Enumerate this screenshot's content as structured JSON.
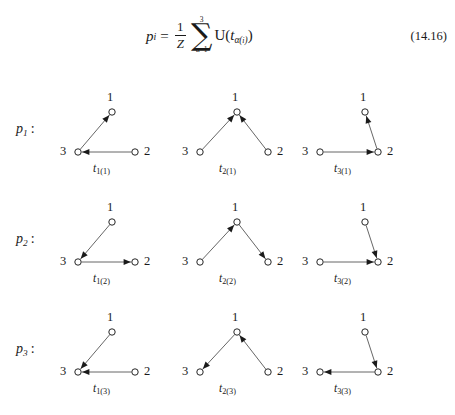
{
  "equation": {
    "lhs_var": "p",
    "lhs_sub": "i",
    "equals": "=",
    "frac_num": "1",
    "frac_den": "Z",
    "sum_upper": "3",
    "sum_lower": "α=1",
    "sigma": "∑",
    "tail_open": "U(",
    "tail_var": "t",
    "tail_sub_alpha": "α(",
    "tail_sub_i": "i",
    "tail_sub_close": ")",
    "tail_close": ")",
    "number": "(14.16)"
  },
  "rows": [
    {
      "label_var": "p",
      "label_sub": "1",
      "label_colon": ":",
      "diagrams": [
        {
          "edge_label_var": "t",
          "edge_label_sub": "1(1)",
          "nodes": [
            {
              "name": "node-1",
              "label": "1",
              "cx": 57,
              "cy": 27,
              "label_x": 52,
              "label_y": 6
            },
            {
              "name": "node-3",
              "label": "3",
              "cx": 23,
              "cy": 67,
              "label_x": 5,
              "label_y": 60
            },
            {
              "name": "node-2",
              "label": "2",
              "cx": 80,
              "cy": 67,
              "label_x": 89,
              "label_y": 60
            }
          ],
          "edges": [
            {
              "name": "edge-3-to-1",
              "from": "node-3",
              "to": "node-1"
            },
            {
              "name": "edge-2-to-3",
              "from": "node-2",
              "to": "node-3"
            }
          ],
          "label_x": 38,
          "label_y": 78
        },
        {
          "edge_label_var": "t",
          "edge_label_sub": "2(1)",
          "nodes": [
            {
              "name": "node-1",
              "label": "1",
              "cx": 52,
              "cy": 27,
              "label_x": 47,
              "label_y": 6
            },
            {
              "name": "node-3",
              "label": "3",
              "cx": 15,
              "cy": 67,
              "label_x": -3,
              "label_y": 60
            },
            {
              "name": "node-2",
              "label": "2",
              "cx": 83,
              "cy": 67,
              "label_x": 92,
              "label_y": 60
            }
          ],
          "edges": [
            {
              "name": "edge-3-to-1",
              "from": "node-3",
              "to": "node-1"
            },
            {
              "name": "edge-2-to-1",
              "from": "node-2",
              "to": "node-1"
            }
          ],
          "label_x": 34,
          "label_y": 78
        },
        {
          "edge_label_var": "t",
          "edge_label_sub": "3(1)",
          "nodes": [
            {
              "name": "node-1",
              "label": "1",
              "cx": 53,
              "cy": 27,
              "label_x": 48,
              "label_y": 6
            },
            {
              "name": "node-3",
              "label": "3",
              "cx": 8,
              "cy": 67,
              "label_x": -10,
              "label_y": 60
            },
            {
              "name": "node-2",
              "label": "2",
              "cx": 66,
              "cy": 67,
              "label_x": 75,
              "label_y": 60
            }
          ],
          "edges": [
            {
              "name": "edge-2-to-1",
              "from": "node-2",
              "to": "node-1"
            },
            {
              "name": "edge-3-to-2",
              "from": "node-3",
              "to": "node-2"
            }
          ],
          "label_x": 22,
          "label_y": 78
        }
      ]
    },
    {
      "label_var": "p",
      "label_sub": "2",
      "label_colon": ":",
      "diagrams": [
        {
          "edge_label_var": "t",
          "edge_label_sub": "1(2)",
          "nodes": [
            {
              "name": "node-1",
              "label": "1",
              "cx": 57,
              "cy": 27,
              "label_x": 52,
              "label_y": 6
            },
            {
              "name": "node-3",
              "label": "3",
              "cx": 23,
              "cy": 67,
              "label_x": 5,
              "label_y": 60
            },
            {
              "name": "node-2",
              "label": "2",
              "cx": 80,
              "cy": 67,
              "label_x": 89,
              "label_y": 60
            }
          ],
          "edges": [
            {
              "name": "edge-1-to-3",
              "from": "node-1",
              "to": "node-3"
            },
            {
              "name": "edge-3-to-2",
              "from": "node-3",
              "to": "node-2"
            }
          ],
          "label_x": 38,
          "label_y": 78
        },
        {
          "edge_label_var": "t",
          "edge_label_sub": "2(2)",
          "nodes": [
            {
              "name": "node-1",
              "label": "1",
              "cx": 52,
              "cy": 27,
              "label_x": 47,
              "label_y": 6
            },
            {
              "name": "node-3",
              "label": "3",
              "cx": 15,
              "cy": 67,
              "label_x": -3,
              "label_y": 60
            },
            {
              "name": "node-2",
              "label": "2",
              "cx": 83,
              "cy": 67,
              "label_x": 92,
              "label_y": 60
            }
          ],
          "edges": [
            {
              "name": "edge-3-to-1",
              "from": "node-3",
              "to": "node-1"
            },
            {
              "name": "edge-1-to-2",
              "from": "node-1",
              "to": "node-2"
            }
          ],
          "label_x": 34,
          "label_y": 78
        },
        {
          "edge_label_var": "t",
          "edge_label_sub": "3(2)",
          "nodes": [
            {
              "name": "node-1",
              "label": "1",
              "cx": 53,
              "cy": 27,
              "label_x": 48,
              "label_y": 6
            },
            {
              "name": "node-3",
              "label": "3",
              "cx": 8,
              "cy": 67,
              "label_x": -10,
              "label_y": 60
            },
            {
              "name": "node-2",
              "label": "2",
              "cx": 66,
              "cy": 67,
              "label_x": 75,
              "label_y": 60
            }
          ],
          "edges": [
            {
              "name": "edge-1-to-2",
              "from": "node-1",
              "to": "node-2"
            },
            {
              "name": "edge-3-to-2",
              "from": "node-3",
              "to": "node-2"
            }
          ],
          "label_x": 22,
          "label_y": 78
        }
      ]
    },
    {
      "label_var": "p",
      "label_sub": "3",
      "label_colon": ":",
      "diagrams": [
        {
          "edge_label_var": "t",
          "edge_label_sub": "1(3)",
          "nodes": [
            {
              "name": "node-1",
              "label": "1",
              "cx": 57,
              "cy": 27,
              "label_x": 52,
              "label_y": 6
            },
            {
              "name": "node-3",
              "label": "3",
              "cx": 23,
              "cy": 67,
              "label_x": 5,
              "label_y": 60
            },
            {
              "name": "node-2",
              "label": "2",
              "cx": 80,
              "cy": 67,
              "label_x": 89,
              "label_y": 60
            }
          ],
          "edges": [
            {
              "name": "edge-1-to-3",
              "from": "node-1",
              "to": "node-3"
            },
            {
              "name": "edge-2-to-3",
              "from": "node-2",
              "to": "node-3"
            }
          ],
          "label_x": 38,
          "label_y": 78
        },
        {
          "edge_label_var": "t",
          "edge_label_sub": "2(3)",
          "nodes": [
            {
              "name": "node-1",
              "label": "1",
              "cx": 52,
              "cy": 27,
              "label_x": 47,
              "label_y": 6
            },
            {
              "name": "node-3",
              "label": "3",
              "cx": 15,
              "cy": 67,
              "label_x": -3,
              "label_y": 60
            },
            {
              "name": "node-2",
              "label": "2",
              "cx": 83,
              "cy": 67,
              "label_x": 92,
              "label_y": 60
            }
          ],
          "edges": [
            {
              "name": "edge-1-to-3",
              "from": "node-1",
              "to": "node-3"
            },
            {
              "name": "edge-2-to-1",
              "from": "node-2",
              "to": "node-1"
            }
          ],
          "label_x": 34,
          "label_y": 78
        },
        {
          "edge_label_var": "t",
          "edge_label_sub": "3(3)",
          "nodes": [
            {
              "name": "node-1",
              "label": "1",
              "cx": 53,
              "cy": 27,
              "label_x": 48,
              "label_y": 6
            },
            {
              "name": "node-3",
              "label": "3",
              "cx": 8,
              "cy": 67,
              "label_x": -10,
              "label_y": 60
            },
            {
              "name": "node-2",
              "label": "2",
              "cx": 66,
              "cy": 67,
              "label_x": 75,
              "label_y": 60
            }
          ],
          "edges": [
            {
              "name": "edge-1-to-2",
              "from": "node-1",
              "to": "node-2"
            },
            {
              "name": "edge-2-to-3",
              "from": "node-2",
              "to": "node-3"
            }
          ],
          "label_x": 22,
          "label_y": 78
        }
      ]
    }
  ],
  "style": {
    "ink": "#1a1a1a",
    "line": "#555555",
    "node_radius": 3.2
  }
}
